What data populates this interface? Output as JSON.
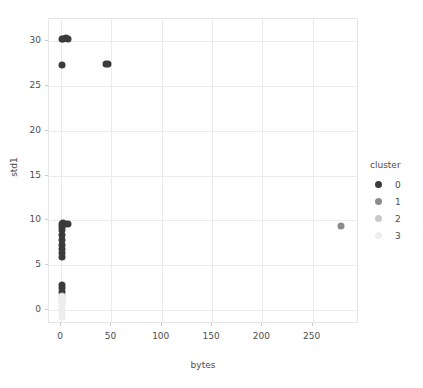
{
  "chart_data": {
    "type": "scatter",
    "title": "",
    "xlabel": "bytes",
    "ylabel": "std1",
    "xlim": [
      -12,
      296
    ],
    "ylim": [
      -1.6,
      32.5
    ],
    "xticks": [
      0,
      50,
      100,
      150,
      200,
      250
    ],
    "yticks": [
      0,
      5,
      10,
      15,
      20,
      25,
      30
    ],
    "grid": true,
    "legend": {
      "title": "cluster",
      "position": "right",
      "entries": [
        {
          "label": "0",
          "color": "#3b3b3b"
        },
        {
          "label": "1",
          "color": "#8c8c8c"
        },
        {
          "label": "2",
          "color": "#c8c8c8"
        },
        {
          "label": "3",
          "color": "#ededed"
        }
      ]
    },
    "series": [
      {
        "name": "0",
        "color": "#3b3b3b",
        "points": [
          {
            "x": 1.0,
            "y": 30.3
          },
          {
            "x": 2.2,
            "y": 30.3
          },
          {
            "x": 5.0,
            "y": 30.4
          },
          {
            "x": 7.0,
            "y": 30.3
          },
          {
            "x": 1.2,
            "y": 27.4
          },
          {
            "x": 44.5,
            "y": 27.5
          },
          {
            "x": 46.5,
            "y": 27.5
          },
          {
            "x": 0.8,
            "y": 9.6
          },
          {
            "x": 1.0,
            "y": 9.3
          },
          {
            "x": 2.0,
            "y": 9.7
          },
          {
            "x": 4.0,
            "y": 9.6
          },
          {
            "x": 6.5,
            "y": 9.6
          },
          {
            "x": 1.0,
            "y": 8.9
          },
          {
            "x": 0.9,
            "y": 8.3
          },
          {
            "x": 1.0,
            "y": 7.8
          },
          {
            "x": 0.9,
            "y": 7.2
          },
          {
            "x": 1.0,
            "y": 6.8
          },
          {
            "x": 0.9,
            "y": 6.3
          },
          {
            "x": 1.0,
            "y": 5.9
          },
          {
            "x": 1.0,
            "y": 2.8
          },
          {
            "x": 1.1,
            "y": 2.4
          },
          {
            "x": 1.0,
            "y": 2.0
          }
        ]
      },
      {
        "name": "1",
        "color": "#8c8c8c",
        "points": [
          {
            "x": 278.0,
            "y": 9.4
          }
        ]
      },
      {
        "name": "2",
        "color": "#c8c8c8",
        "points": [
          {
            "x": 1.0,
            "y": 1.5
          },
          {
            "x": 1.0,
            "y": 1.1
          }
        ]
      },
      {
        "name": "3",
        "color": "#ededed",
        "points": [
          {
            "x": 1.0,
            "y": 1.4
          },
          {
            "x": 1.0,
            "y": 1.0
          },
          {
            "x": 1.0,
            "y": 0.7
          },
          {
            "x": 1.0,
            "y": 0.4
          },
          {
            "x": 1.0,
            "y": 0.1
          },
          {
            "x": 1.0,
            "y": -0.2
          },
          {
            "x": 1.0,
            "y": -0.5
          },
          {
            "x": 1.0,
            "y": -0.8
          }
        ]
      }
    ]
  }
}
